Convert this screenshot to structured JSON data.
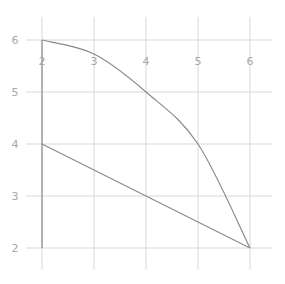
{
  "chart_data": {
    "type": "line",
    "title": "",
    "xlabel": "",
    "ylabel": "",
    "xlim": [
      2,
      6
    ],
    "ylim": [
      2,
      6
    ],
    "grid": true,
    "legend": null,
    "x_ticks": [
      2,
      3,
      4,
      5,
      6
    ],
    "y_ticks": [
      2,
      3,
      4,
      5,
      6
    ],
    "series": [
      {
        "name": "curve",
        "kind": "curve",
        "points": [
          [
            2,
            6
          ],
          [
            3,
            5.73
          ],
          [
            4,
            5
          ],
          [
            5,
            4
          ],
          [
            6,
            2
          ]
        ]
      },
      {
        "name": "segment",
        "kind": "line",
        "points": [
          [
            2,
            4
          ],
          [
            6,
            2
          ]
        ]
      },
      {
        "name": "vertical",
        "kind": "line",
        "points": [
          [
            2,
            6
          ],
          [
            2,
            2
          ]
        ]
      }
    ],
    "colors": {
      "line": "#8a8a8a",
      "grid": "#d8d8d8",
      "tick_label": "#a8a8a8"
    }
  }
}
